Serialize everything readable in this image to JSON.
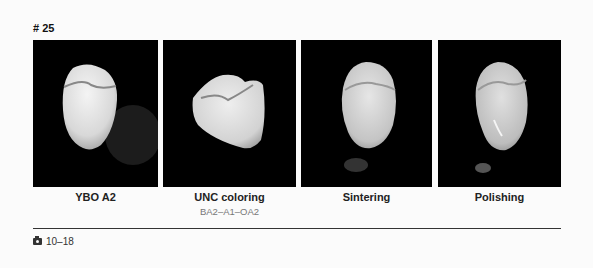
{
  "figure": {
    "number_label": "# 25",
    "panels": [
      {
        "caption": "YBO A2",
        "subcaption": ""
      },
      {
        "caption": "UNC coloring",
        "subcaption": "BA2–A1–OA2"
      },
      {
        "caption": "Sintering",
        "subcaption": ""
      },
      {
        "caption": "Polishing",
        "subcaption": ""
      }
    ],
    "photo_ref": "10–18",
    "photo_icon": "camera-icon"
  }
}
